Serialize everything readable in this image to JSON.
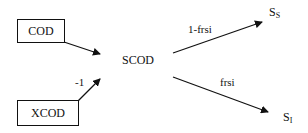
{
  "diagram": {
    "nodes": {
      "cod": {
        "label": "COD"
      },
      "xcod": {
        "label": "XCOD"
      },
      "scod": {
        "label": "SCOD"
      },
      "ss": {
        "label": "S",
        "sub": "S"
      },
      "si": {
        "label": "S",
        "sub": "I"
      }
    },
    "edges": [
      {
        "from": "COD",
        "to": "SCOD",
        "label": ""
      },
      {
        "from": "XCOD",
        "to": "SCOD",
        "label": "-1"
      },
      {
        "from": "SCOD",
        "to": "S_S",
        "label": "1-frsi"
      },
      {
        "from": "SCOD",
        "to": "S_I",
        "label": "frsi"
      }
    ]
  }
}
